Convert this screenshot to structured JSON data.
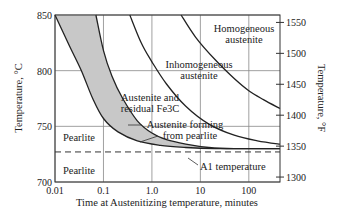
{
  "chart_data": {
    "type": "line",
    "title": "",
    "xlabel": "Time at Austenitizing temperature, minutes",
    "ylabel": "Temperature, °C",
    "ylabel_right": "Temperature, °F",
    "xscale": "log",
    "xlim": [
      0.01,
      440
    ],
    "ylim": [
      700,
      850
    ],
    "ylim_right": [
      1292,
      1562
    ],
    "x_ticks": [
      0.01,
      0.1,
      1.0,
      10,
      100
    ],
    "x_tick_labels": [
      "0.01",
      "0.1",
      "1.0",
      "10",
      "100"
    ],
    "y_ticks": [
      700,
      750,
      800,
      850
    ],
    "y_tick_labels": [
      "700",
      "750",
      "800",
      "850"
    ],
    "y_right_ticks": [
      1300,
      1350,
      1400,
      1450,
      1500,
      1550
    ],
    "y_right_tick_labels": [
      "1300",
      "1350",
      "1400",
      "1450",
      "1500",
      "1550"
    ],
    "grid": true,
    "series": [
      {
        "name": "Start of austenite formation",
        "x": [
          0.01,
          0.02,
          0.035,
          0.06,
          0.1,
          0.2,
          0.5,
          1.5,
          5,
          20,
          100,
          440
        ],
        "y": [
          850,
          822,
          800,
          775,
          757,
          745,
          737,
          733,
          731,
          730,
          730,
          730
        ]
      },
      {
        "name": "End of pearlite transformation",
        "x": [
          0.07,
          0.1,
          0.15,
          0.25,
          0.5,
          1.0,
          2,
          5,
          15,
          50,
          440
        ],
        "y": [
          850,
          818,
          795,
          775,
          755,
          744,
          738,
          734,
          731,
          730,
          730
        ]
      },
      {
        "name": "Carbide dissolution complete",
        "x": [
          0.35,
          0.6,
          1.0,
          2,
          5,
          15,
          50,
          150,
          440
        ],
        "y": [
          850,
          825,
          808,
          788,
          768,
          752,
          742,
          737,
          734
        ]
      },
      {
        "name": "Homogenization complete",
        "x": [
          4,
          8,
          20,
          50,
          100,
          200,
          440
        ],
        "y": [
          850,
          830,
          810,
          793,
          782,
          774,
          766
        ]
      }
    ],
    "reference_lines": [
      {
        "name": "A1 temperature",
        "y": 727,
        "style": "dashed"
      }
    ],
    "annotations": [
      {
        "text": "Homogeneous",
        "text2": "austenite"
      },
      {
        "text": "Inhomogeneous",
        "text2": "austenite"
      },
      {
        "text": "Austenite and",
        "text2": "residual Fe3C"
      },
      {
        "text": "Austenite forming",
        "text2": "from pearlite"
      },
      {
        "text": "Pearlite"
      },
      {
        "text": "Pearlite"
      },
      {
        "text": "A1 temperature"
      }
    ],
    "legend": "none"
  }
}
